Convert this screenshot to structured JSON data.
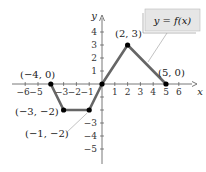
{
  "chart_data": {
    "type": "line",
    "title": "",
    "xlabel": "x",
    "ylabel": "y",
    "xlim": [
      -6.5,
      6.5
    ],
    "ylim": [
      -6,
      5
    ],
    "grid": false,
    "x_ticks": [
      -6,
      -5,
      -3,
      -2,
      -1,
      1,
      2,
      3,
      4,
      5,
      6
    ],
    "x_tick_labels": [
      "−6",
      "−5",
      "−3",
      "−2",
      "−1",
      "1",
      "2",
      "3",
      "4",
      "5",
      "6"
    ],
    "y_ticks": [
      4,
      3,
      2,
      1,
      -3,
      -4,
      -5
    ],
    "y_tick_labels": [
      "4",
      "3",
      "2",
      "1",
      "−3",
      "−4",
      "−5"
    ],
    "series": [
      {
        "name": "y = f(x)",
        "x": [
          -4,
          -3,
          -1,
          0,
          2,
          5
        ],
        "y": [
          0,
          -2,
          -2,
          0,
          3,
          0
        ],
        "color": "#666666"
      }
    ],
    "annotations": [
      {
        "text": "(−4, 0)",
        "x": -4,
        "y": 0
      },
      {
        "text": "(−3, −2)",
        "x": -3,
        "y": -2
      },
      {
        "text": "(−1, −2)",
        "x": -1,
        "y": -2
      },
      {
        "text": "(2, 3)",
        "x": 2,
        "y": 3
      },
      {
        "text": "(5, 0)",
        "x": 5,
        "y": 0
      }
    ],
    "legend": {
      "text": "y = f(x)",
      "position": "top-right",
      "background": "#e6e6e6"
    }
  }
}
